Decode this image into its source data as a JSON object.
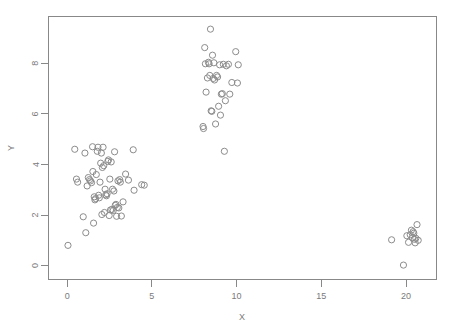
{
  "figure": {
    "background_color": "#ffffff",
    "frame_color": "#888888",
    "point_color": "#8c8c8c",
    "text_color": "#7a7a7a"
  },
  "chart_data": {
    "type": "scatter",
    "title": "",
    "subtitle": "",
    "xlabel": "X",
    "ylabel": "Y",
    "xlim": [
      -1.1,
      21.8
    ],
    "ylim": [
      -0.55,
      9.85
    ],
    "xticks": [
      0,
      5,
      10,
      15,
      20
    ],
    "xticklabels": [
      "0",
      "5",
      "10",
      "15",
      "20"
    ],
    "yticks": [
      0,
      2,
      4,
      6,
      8
    ],
    "yticklabels": [
      "0",
      "2",
      "4",
      "6",
      "8"
    ],
    "grid": false,
    "legend": null,
    "marker": "open-circle",
    "marker_size": 3.1,
    "n_points": 110,
    "clusters": [
      {
        "name": "left-cluster",
        "approx_center": [
          2.0,
          3.0
        ],
        "count": 62
      },
      {
        "name": "middle-cluster",
        "approx_center": [
          8.9,
          7.0
        ],
        "count": 34
      },
      {
        "name": "right-cluster",
        "approx_center": [
          20.2,
          1.1
        ],
        "count": 14
      }
    ],
    "series": [
      {
        "name": "points",
        "points": [
          [
            0.05,
            0.8
          ],
          [
            0.45,
            4.6
          ],
          [
            0.55,
            3.42
          ],
          [
            0.62,
            3.3
          ],
          [
            0.95,
            1.93
          ],
          [
            1.05,
            4.45
          ],
          [
            1.1,
            1.3
          ],
          [
            1.18,
            3.15
          ],
          [
            1.25,
            3.48
          ],
          [
            1.32,
            3.4
          ],
          [
            1.38,
            3.35
          ],
          [
            1.44,
            3.28
          ],
          [
            1.5,
            4.7
          ],
          [
            1.52,
            3.72
          ],
          [
            1.56,
            1.68
          ],
          [
            1.6,
            2.72
          ],
          [
            1.64,
            2.6
          ],
          [
            1.68,
            2.65
          ],
          [
            1.72,
            3.6
          ],
          [
            1.78,
            4.52
          ],
          [
            1.82,
            4.68
          ],
          [
            1.86,
            2.78
          ],
          [
            1.9,
            2.68
          ],
          [
            1.94,
            3.3
          ],
          [
            1.98,
            4.05
          ],
          [
            2.02,
            4.45
          ],
          [
            2.05,
            2.02
          ],
          [
            2.08,
            3.88
          ],
          [
            2.12,
            4.68
          ],
          [
            2.16,
            3.95
          ],
          [
            2.2,
            2.1
          ],
          [
            2.24,
            3.02
          ],
          [
            2.28,
            2.8
          ],
          [
            2.32,
            2.76
          ],
          [
            2.36,
            2.84
          ],
          [
            2.4,
            4.12
          ],
          [
            2.44,
            4.18
          ],
          [
            2.48,
            1.98
          ],
          [
            2.52,
            3.42
          ],
          [
            2.56,
            2.2
          ],
          [
            2.6,
            4.1
          ],
          [
            2.64,
            2.22
          ],
          [
            2.68,
            3.02
          ],
          [
            2.72,
            2.18
          ],
          [
            2.76,
            2.95
          ],
          [
            2.8,
            4.5
          ],
          [
            2.84,
            2.38
          ],
          [
            2.88,
            2.42
          ],
          [
            2.92,
            1.95
          ],
          [
            2.96,
            2.3
          ],
          [
            3.0,
            3.35
          ],
          [
            3.05,
            2.28
          ],
          [
            3.1,
            3.4
          ],
          [
            3.14,
            3.3
          ],
          [
            3.2,
            1.96
          ],
          [
            3.3,
            2.52
          ],
          [
            3.45,
            3.62
          ],
          [
            3.62,
            3.38
          ],
          [
            3.9,
            4.58
          ],
          [
            3.95,
            2.98
          ],
          [
            4.4,
            3.2
          ],
          [
            4.55,
            3.18
          ],
          [
            8.02,
            5.5
          ],
          [
            8.05,
            5.42
          ],
          [
            8.12,
            8.62
          ],
          [
            8.16,
            7.98
          ],
          [
            8.2,
            6.86
          ],
          [
            8.28,
            7.42
          ],
          [
            8.34,
            8.04
          ],
          [
            8.38,
            7.98
          ],
          [
            8.42,
            7.52
          ],
          [
            8.46,
            9.35
          ],
          [
            8.5,
            6.12
          ],
          [
            8.54,
            6.1
          ],
          [
            8.58,
            8.32
          ],
          [
            8.62,
            7.4
          ],
          [
            8.66,
            8.02
          ],
          [
            8.7,
            7.34
          ],
          [
            8.76,
            5.6
          ],
          [
            8.82,
            7.52
          ],
          [
            8.88,
            7.46
          ],
          [
            8.94,
            6.3
          ],
          [
            9.0,
            7.94
          ],
          [
            9.05,
            5.95
          ],
          [
            9.1,
            6.78
          ],
          [
            9.16,
            6.8
          ],
          [
            9.22,
            7.96
          ],
          [
            9.28,
            4.52
          ],
          [
            9.34,
            6.52
          ],
          [
            9.4,
            7.9
          ],
          [
            9.52,
            7.96
          ],
          [
            9.6,
            6.78
          ],
          [
            9.72,
            7.24
          ],
          [
            9.95,
            8.46
          ],
          [
            10.05,
            7.22
          ],
          [
            10.1,
            7.94
          ],
          [
            19.15,
            1.02
          ],
          [
            19.85,
            0.02
          ],
          [
            20.05,
            1.18
          ],
          [
            20.15,
            0.92
          ],
          [
            20.25,
            1.22
          ],
          [
            20.32,
            1.4
          ],
          [
            20.38,
            1.1
          ],
          [
            20.42,
            1.34
          ],
          [
            20.46,
            1.28
          ],
          [
            20.5,
            1.04
          ],
          [
            20.54,
            0.9
          ],
          [
            20.58,
            1.08
          ],
          [
            20.65,
            1.62
          ],
          [
            20.72,
            1.0
          ]
        ]
      }
    ]
  }
}
